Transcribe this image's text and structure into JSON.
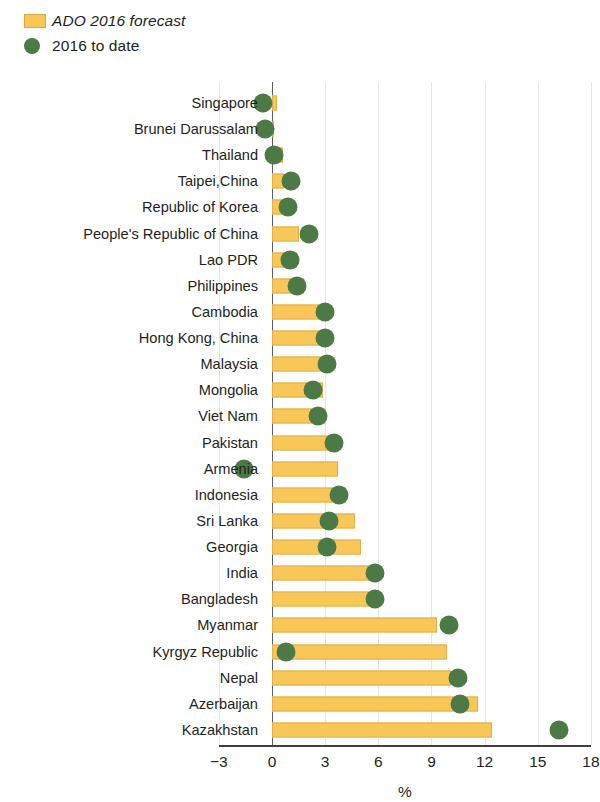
{
  "legend": {
    "items": [
      {
        "label": "ADO 2016 forecast",
        "marker": "square",
        "color": "#F9C758",
        "italic": true
      },
      {
        "label": "2016 to date",
        "marker": "circle",
        "color": "#4C7A46",
        "italic": false
      }
    ]
  },
  "axis": {
    "x_title": "%",
    "ticks": [
      "−3",
      "0",
      "3",
      "6",
      "9",
      "12",
      "15",
      "18"
    ]
  },
  "chart_data": {
    "type": "bar",
    "orientation": "horizontal",
    "title": "",
    "subtitle": "",
    "xlabel": "%",
    "ylabel": "",
    "xlim": [
      -3,
      18
    ],
    "xticks": [
      -3,
      0,
      3,
      6,
      9,
      12,
      15,
      18
    ],
    "grid": true,
    "legend_position": "top-left",
    "categories": [
      "Singapore",
      "Brunei Darussalam",
      "Thailand",
      "Taipei,China",
      "Republic of Korea",
      "People's Republic of China",
      "Lao PDR",
      "Philippines",
      "Cambodia",
      "Hong Kong, China",
      "Malaysia",
      "Mongolia",
      "Viet Nam",
      "Pakistan",
      "Armenia",
      "Indonesia",
      "Sri Lanka",
      "Georgia",
      "India",
      "Bangladesh",
      "Myanmar",
      "Kyrgyz Republic",
      "Nepal",
      "Azerbaijan",
      "Kazakhstan"
    ],
    "series": [
      {
        "name": "ADO 2016 forecast",
        "type": "bar",
        "color": "#F9C758",
        "values": [
          0.3,
          0.1,
          0.6,
          0.7,
          0.9,
          1.5,
          1.4,
          1.8,
          2.8,
          2.8,
          2.9,
          2.9,
          3.0,
          3.2,
          3.7,
          4.2,
          4.7,
          5.0,
          5.6,
          5.6,
          9.3,
          9.9,
          10.1,
          11.6,
          12.4
        ]
      },
      {
        "name": "2016 to date",
        "type": "scatter",
        "color": "#4C7A46",
        "values": [
          -0.5,
          -0.4,
          0.1,
          1.1,
          0.9,
          2.1,
          1.0,
          1.4,
          3.0,
          3.0,
          3.1,
          2.3,
          2.6,
          3.5,
          -1.6,
          3.8,
          3.2,
          3.1,
          5.8,
          5.8,
          10.0,
          0.8,
          10.5,
          10.6,
          16.2
        ]
      }
    ]
  }
}
